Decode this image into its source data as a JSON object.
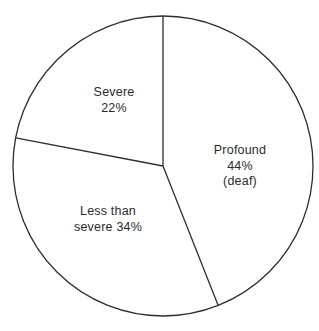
{
  "chart_data": {
    "type": "pie",
    "title": "",
    "slices": [
      {
        "label": "Profound",
        "value": 44,
        "note": "(deaf)"
      },
      {
        "label": "Less than severe",
        "value": 34,
        "note": ""
      },
      {
        "label": "Severe",
        "value": 22,
        "note": ""
      }
    ],
    "units": "%",
    "start_angle_deg": 0,
    "direction": "clockwise",
    "slice_fill": "#ffffff",
    "stroke_color": "#2e2e2e",
    "legend": "none",
    "labels_position": "inside"
  },
  "labels": {
    "severe": {
      "line1": "Severe",
      "line2": "22%"
    },
    "profound": {
      "line1": "Profound",
      "line2": "44%",
      "line3": "(deaf)"
    },
    "less_than_severe": {
      "line1": "Less than",
      "line2": "severe 34%"
    }
  }
}
